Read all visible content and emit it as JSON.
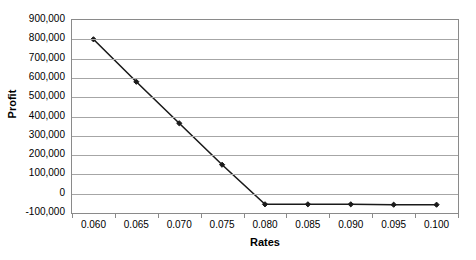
{
  "chart_data": {
    "type": "line",
    "title": "",
    "xlabel": "Rates",
    "ylabel": "Profit",
    "categories": [
      "0.060",
      "0.065",
      "0.070",
      "0.075",
      "0.080",
      "0.085",
      "0.090",
      "0.095",
      "0.100"
    ],
    "values": [
      800000,
      580000,
      365000,
      150000,
      -55000,
      -55000,
      -55000,
      -57000,
      -57000
    ],
    "series": [
      {
        "name": "Profit",
        "values": [
          800000,
          580000,
          365000,
          150000,
          -55000,
          -55000,
          -55000,
          -57000,
          -57000
        ]
      }
    ],
    "ylim": [
      -100000,
      900000
    ],
    "ytick_labels": [
      "900,000",
      "800,000",
      "700,000",
      "600,000",
      "500,000",
      "400,000",
      "300,000",
      "200,000",
      "100,000",
      "0",
      "-100,000"
    ],
    "ytick_values": [
      900000,
      800000,
      700000,
      600000,
      500000,
      400000,
      300000,
      200000,
      100000,
      0,
      -100000
    ],
    "grid": "horizontal",
    "legend": "none",
    "marker": "filled-diamond",
    "line_color": "#1a1a1a",
    "grid_color": "#a6a6a6",
    "axis_color": "#8a8a8a",
    "background_color": "#ffffff"
  }
}
